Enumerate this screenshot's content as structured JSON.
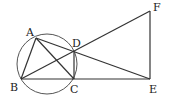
{
  "diagram": {
    "points": {
      "A": {
        "label": "A",
        "x": 36,
        "y": 38
      },
      "B": {
        "label": "B",
        "x": 21,
        "y": 79
      },
      "C": {
        "label": "C",
        "x": 74,
        "y": 79
      },
      "D": {
        "label": "D",
        "x": 74,
        "y": 52
      },
      "E": {
        "label": "E",
        "x": 150,
        "y": 79
      },
      "F": {
        "label": "F",
        "x": 150,
        "y": 11
      }
    },
    "circle": {
      "cx": 47,
      "cy": 64,
      "r": 30
    },
    "segments": [
      "AB",
      "AC",
      "AE",
      "BF",
      "BE",
      "CD",
      "EF"
    ],
    "line_color": "#333333"
  }
}
